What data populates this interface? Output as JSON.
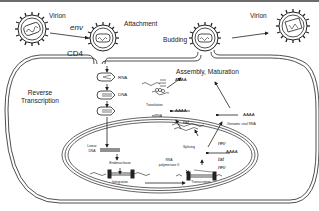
{
  "diagram": {
    "labels": {
      "virion_left": "Virion",
      "virion_right": "Virion",
      "env": "env",
      "attachment": "Attachment",
      "cd4": "CD4",
      "budding": "Budding",
      "assembly": "Assembly, Maturation",
      "reverse_transcription_1": "Reverse",
      "reverse_transcription_2": "Transcription",
      "rna": "RNA",
      "dna": "DNA",
      "translation": "Translation",
      "mrna": "mRNA",
      "aaaa_1": "AAAA",
      "aaaa_2": "AAAA",
      "aaaa_3": "AAAA",
      "tat_1": "tat",
      "tat_2": "tat",
      "rev_1": "rev",
      "rev_2": "rev",
      "genomic_viral_rna": "Genomic viral RNA",
      "splicing": "Splicing",
      "linear_dna_1": "Linear",
      "linear_dna_2": "DNA",
      "endonuclease": "Endonuclease",
      "integration": "Integration",
      "rna_polymerase_1": "RNA",
      "rna_polymerase_2": "polymerase II",
      "transcription": "Transcription"
    },
    "colors": {
      "line": "#222222",
      "background": "#ffffff",
      "topbar": "#6b6b6b"
    }
  }
}
